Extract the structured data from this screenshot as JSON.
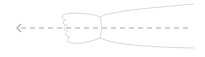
{
  "illustration": {
    "subject": "arm-extended-left",
    "direction": "left",
    "colors": {
      "outline": "#d8d8d8",
      "dashed_line": "#a8a8a8",
      "background": "#ffffff"
    }
  }
}
